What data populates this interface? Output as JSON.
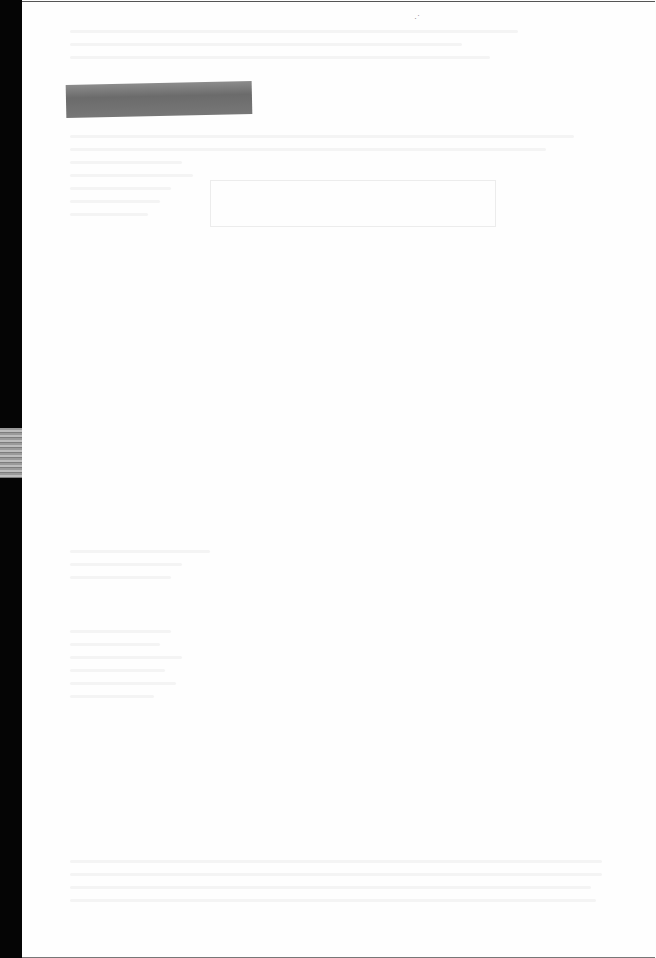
{
  "document": {
    "type": "scanned-page",
    "condition": "overexposed",
    "legible_text": [],
    "tape_label_text": "",
    "boxed_region_text": ""
  }
}
